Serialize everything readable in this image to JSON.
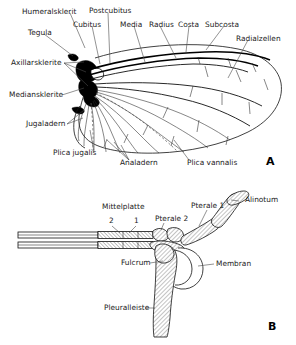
{
  "figure": {
    "title_a": "A",
    "title_b": "B",
    "background_color": "#ffffff",
    "ink_color": "#111111",
    "label_color": "#1b1b1b"
  },
  "panel_a": {
    "letter": "A",
    "subject": "insect-wing-venation-diagram",
    "labels": [
      {
        "id": "humeralsklerit",
        "text": "Humeralsklerit"
      },
      {
        "id": "postcubitus",
        "text": "Postcubitus"
      },
      {
        "id": "tegula",
        "text": "Tegula"
      },
      {
        "id": "cubitus",
        "text": "Cubitus"
      },
      {
        "id": "media",
        "text": "Media"
      },
      {
        "id": "radius",
        "text": "Radius"
      },
      {
        "id": "costa",
        "text": "Costa"
      },
      {
        "id": "subcosta",
        "text": "Subcosta"
      },
      {
        "id": "radialzellen",
        "text": "Radialzellen"
      },
      {
        "id": "axillarsklerite",
        "text": "Axillarsklerite"
      },
      {
        "id": "mediansklerite",
        "text": "Mediansklerite"
      },
      {
        "id": "jugaladern",
        "text": "Jugaladern"
      },
      {
        "id": "plica-jugalis",
        "text": "Plica jugalis"
      },
      {
        "id": "analadern",
        "text": "Analadern"
      },
      {
        "id": "plica-vannalis",
        "text": "Plica vannalis"
      }
    ]
  },
  "panel_b": {
    "letter": "B",
    "subject": "wing-articulation-cross-section",
    "labels": [
      {
        "id": "mittelplatte",
        "text": "Mittelplatte"
      },
      {
        "id": "mittelplatte-2",
        "text": "2"
      },
      {
        "id": "mittelplatte-1",
        "text": "1"
      },
      {
        "id": "pterale-2",
        "text": "Pterale 2"
      },
      {
        "id": "pterale-1",
        "text": "Pterale 1"
      },
      {
        "id": "alinotum",
        "text": "Alinotum"
      },
      {
        "id": "membran",
        "text": "Membran"
      },
      {
        "id": "fulcrum",
        "text": "Fulcrum"
      },
      {
        "id": "pleuralleiste",
        "text": "Pleuralleiste"
      }
    ]
  }
}
